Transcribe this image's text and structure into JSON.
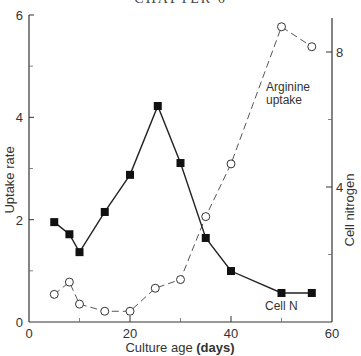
{
  "page": {
    "header": "CHAPTER 6"
  },
  "chart_data": {
    "type": "line",
    "title": "",
    "xlabel": "Culture age",
    "xlabel_unit": "(days)",
    "ylabel": "Uptake rate",
    "ylabel_right": "Cell nitrogen",
    "xlim": [
      0,
      60
    ],
    "ylim": [
      0,
      6
    ],
    "ylim_right": [
      0,
      8.8
    ],
    "x_ticks": [
      0,
      20,
      40,
      60
    ],
    "x_minor_ticks": [
      10,
      30,
      50
    ],
    "y_ticks": [
      0,
      2,
      4,
      6
    ],
    "y_minor_ticks": [
      1,
      3,
      5
    ],
    "y_right_ticks": [
      4,
      8
    ],
    "y_right_minor_ticks": [
      2,
      6
    ],
    "grid": false,
    "legend": "inline labels",
    "series": [
      {
        "name": "Arginine uptake",
        "label_lines": [
          "Arginine",
          "uptake"
        ],
        "axis": "left",
        "marker": "open-circle",
        "line_style": "dashed",
        "x": [
          5,
          8,
          10,
          15,
          20,
          25,
          30,
          35,
          40,
          50,
          56
        ],
        "values": [
          0.54,
          0.78,
          0.35,
          0.21,
          0.21,
          0.66,
          0.83,
          2.06,
          3.09,
          5.77,
          5.38
        ]
      },
      {
        "name": "Cell N",
        "label_lines": [
          "Cell  N"
        ],
        "axis": "right",
        "marker": "filled-square",
        "line_style": "solid",
        "x": [
          5,
          8,
          10,
          15,
          20,
          25.5,
          30,
          35,
          40,
          50,
          56
        ],
        "values": [
          2.96,
          2.6,
          2.07,
          3.26,
          4.36,
          6.4,
          4.71,
          2.49,
          1.51,
          0.86,
          0.86
        ]
      }
    ]
  }
}
